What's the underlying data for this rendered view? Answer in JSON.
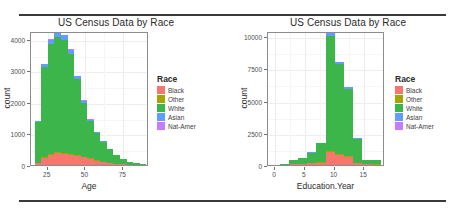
{
  "figure": {
    "rule_color": "#3a3a3a"
  },
  "palette": {
    "Black": "#F8766D",
    "Other": "#A3A500",
    "White": "#3CB54A",
    "Asian": "#619CFF",
    "Nat-Amer": "#C77CFF"
  },
  "legend": {
    "title": "Race",
    "items": [
      {
        "label": "Black",
        "color": "#F8766D"
      },
      {
        "label": "Other",
        "color": "#A3A500"
      },
      {
        "label": "White",
        "color": "#3CB54A"
      },
      {
        "label": "Asian",
        "color": "#619CFF"
      },
      {
        "label": "Nat-Amer",
        "color": "#C77CFF"
      }
    ]
  },
  "chart_data": [
    {
      "id": "age-histogram",
      "type": "bar",
      "title": "US Census Data by Race",
      "xlabel": "Age",
      "ylabel": "count",
      "stacked": true,
      "grid": true,
      "legend_position": "right",
      "xlim": [
        14,
        92
      ],
      "ylim": [
        0,
        4250
      ],
      "xticks": [
        25,
        50,
        75
      ],
      "yticks": [
        0,
        1000,
        2000,
        3000,
        4000
      ],
      "xtick_labels": [
        "25",
        "50",
        "75"
      ],
      "ytick_labels": [
        "0",
        "1000",
        "2000",
        "3000",
        "4000"
      ],
      "bin_width": 4.33,
      "bin_starts": [
        16.5,
        20.8,
        25.2,
        29.5,
        33.8,
        38.2,
        42.5,
        46.8,
        51.2,
        55.5,
        59.8,
        64.2,
        68.5,
        72.8,
        77.2,
        81.5,
        85.8
      ],
      "series": [
        {
          "name": "Black",
          "values": [
            60,
            230,
            330,
            370,
            360,
            330,
            290,
            250,
            195,
            140,
            95,
            62,
            40,
            24,
            14,
            8,
            5
          ]
        },
        {
          "name": "Other",
          "values": [
            8,
            26,
            34,
            36,
            34,
            30,
            24,
            19,
            14,
            10,
            7,
            4,
            3,
            2,
            1,
            1,
            0
          ]
        },
        {
          "name": "White",
          "values": [
            1290,
            2840,
            3460,
            3640,
            3560,
            3160,
            2400,
            1700,
            1190,
            880,
            640,
            430,
            270,
            150,
            80,
            40,
            22
          ]
        },
        {
          "name": "Asian",
          "values": [
            28,
            100,
            150,
            170,
            165,
            140,
            105,
            70,
            45,
            28,
            18,
            11,
            7,
            4,
            2,
            1,
            1
          ]
        },
        {
          "name": "Nat-Amer",
          "values": [
            4,
            14,
            19,
            21,
            20,
            17,
            13,
            9,
            6,
            4,
            3,
            2,
            1,
            1,
            0,
            0,
            0
          ]
        }
      ]
    },
    {
      "id": "education-year-histogram",
      "type": "bar",
      "title": "US Census Data by Race",
      "xlabel": "Education.Year",
      "ylabel": "count",
      "stacked": true,
      "grid": true,
      "legend_position": "right",
      "xlim": [
        -1.2,
        18.5
      ],
      "ylim": [
        0,
        10400
      ],
      "xticks": [
        0,
        5,
        10,
        15
      ],
      "yticks": [
        0,
        2500,
        5000,
        7500,
        10000
      ],
      "xtick_labels": [
        "0",
        "5",
        "10",
        "15"
      ],
      "ytick_labels": [
        "0",
        "2500",
        "5000",
        "7500",
        "10000"
      ],
      "bin_width": 1.55,
      "bin_starts": [
        -0.8,
        0.75,
        2.3,
        3.85,
        5.4,
        6.95,
        8.5,
        10.05,
        11.6,
        13.15,
        14.7,
        16.25
      ],
      "series": [
        {
          "name": "Black",
          "values": [
            2,
            10,
            55,
            80,
            140,
            175,
            1020,
            760,
            620,
            140,
            60,
            40
          ]
        },
        {
          "name": "Other",
          "values": [
            0,
            2,
            8,
            12,
            20,
            22,
            96,
            72,
            58,
            14,
            7,
            4
          ]
        },
        {
          "name": "White",
          "values": [
            8,
            50,
            290,
            430,
            790,
            1490,
            8870,
            7010,
            5210,
            1900,
            320,
            330
          ]
        },
        {
          "name": "Asian",
          "values": [
            1,
            3,
            14,
            20,
            34,
            44,
            250,
            160,
            150,
            50,
            18,
            14
          ]
        },
        {
          "name": "Nat-Amer",
          "values": [
            0,
            1,
            3,
            4,
            6,
            8,
            36,
            24,
            20,
            6,
            2,
            2
          ]
        }
      ]
    }
  ]
}
